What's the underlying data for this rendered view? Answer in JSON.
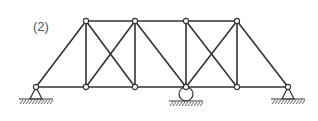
{
  "figure": {
    "label": "(2)",
    "type": "planar truss",
    "member_color": "#333333",
    "node_style": "hinge",
    "nodes": {
      "B1": [
        36,
        87
      ],
      "B2": [
        86,
        87
      ],
      "B3": [
        135,
        87
      ],
      "B4": [
        186,
        87
      ],
      "B5": [
        237,
        87
      ],
      "B6": [
        288,
        87
      ],
      "T1": [
        86,
        21
      ],
      "T2": [
        135,
        21
      ],
      "T3": [
        186,
        21
      ],
      "T4": [
        237,
        21
      ]
    },
    "members": [
      [
        "B1",
        "B2"
      ],
      [
        "B2",
        "B3"
      ],
      [
        "B3",
        "B4"
      ],
      [
        "B4",
        "B5"
      ],
      [
        "B5",
        "B6"
      ],
      [
        "T1",
        "T2"
      ],
      [
        "T2",
        "T3"
      ],
      [
        "T3",
        "T4"
      ],
      [
        "B1",
        "T1"
      ],
      [
        "T1",
        "B2"
      ],
      [
        "T1",
        "B3"
      ],
      [
        "B2",
        "T2"
      ],
      [
        "T2",
        "B3"
      ],
      [
        "T2",
        "B4"
      ],
      [
        "T3",
        "B4"
      ],
      [
        "T3",
        "B5"
      ],
      [
        "B4",
        "T4"
      ],
      [
        "T4",
        "B5"
      ],
      [
        "T4",
        "B6"
      ]
    ],
    "supports": [
      {
        "node": "B1",
        "type": "pin"
      },
      {
        "node": "B4",
        "type": "roller"
      },
      {
        "node": "B6",
        "type": "pin"
      }
    ]
  }
}
